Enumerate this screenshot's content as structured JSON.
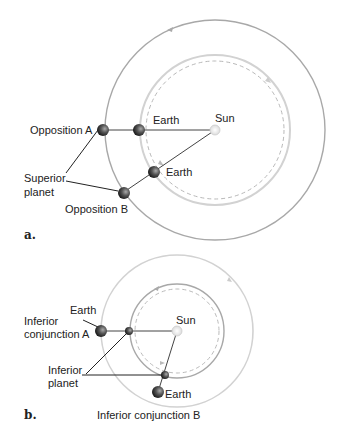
{
  "panel_a": {
    "label": "a.",
    "sun": "Sun",
    "earth_a": "Earth",
    "earth_b": "Earth",
    "opposition_a": "Opposition A",
    "opposition_b": "Opposition B",
    "superior_line1": "Superior",
    "superior_line2": "planet"
  },
  "panel_b": {
    "label": "b.",
    "sun": "Sun",
    "earth_a": "Earth",
    "earth_b": "Earth",
    "conj_a_line1": "Inferior",
    "conj_a_line2": "conjunction A",
    "conj_b": "Inferior conjunction B",
    "inferior_line1": "Inferior",
    "inferior_line2": "planet"
  },
  "colors": {
    "orbit_gray": "#a8a8a8",
    "orbit_light": "#d0d0d0",
    "line": "#333333",
    "planet_dark": "#2a2a2a"
  }
}
